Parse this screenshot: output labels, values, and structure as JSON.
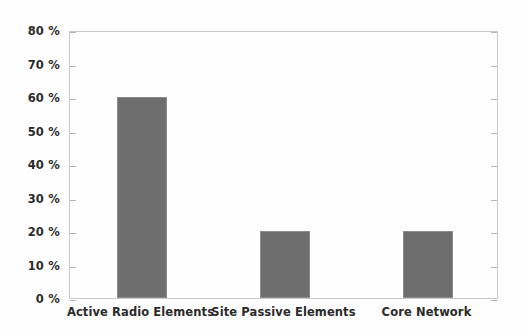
{
  "chart_data": {
    "type": "bar",
    "title": "",
    "subtitle": "",
    "xlabel": "",
    "ylabel": "",
    "categories": [
      "Active Radio Elements",
      "Site Passive Elements",
      "Core Network"
    ],
    "values": [
      60,
      20,
      20
    ],
    "value_unit": "%",
    "ylim": [
      0,
      80
    ],
    "ytick_step": 10,
    "ytick_labels": [
      "80 %",
      "70 %",
      "60 %",
      "50 %",
      "40 %",
      "30 %",
      "20 %",
      "10 %",
      "0 %"
    ],
    "ytick_values": [
      80,
      70,
      60,
      50,
      40,
      30,
      20,
      10,
      0
    ],
    "grid": false,
    "legend": null,
    "legend_position": "none",
    "series": [
      {
        "name": "",
        "values": [
          60,
          20,
          20
        ],
        "color": "#6e6e6e"
      }
    ],
    "annotations": []
  },
  "style": {
    "bar_fill": "#6e6e6e",
    "bar_edge": "#8c8c8c",
    "frame_color": "#c9c9c9",
    "tick_color": "#b4b4b4",
    "text_color": "#2b2b2b",
    "background": "#fefefe"
  }
}
